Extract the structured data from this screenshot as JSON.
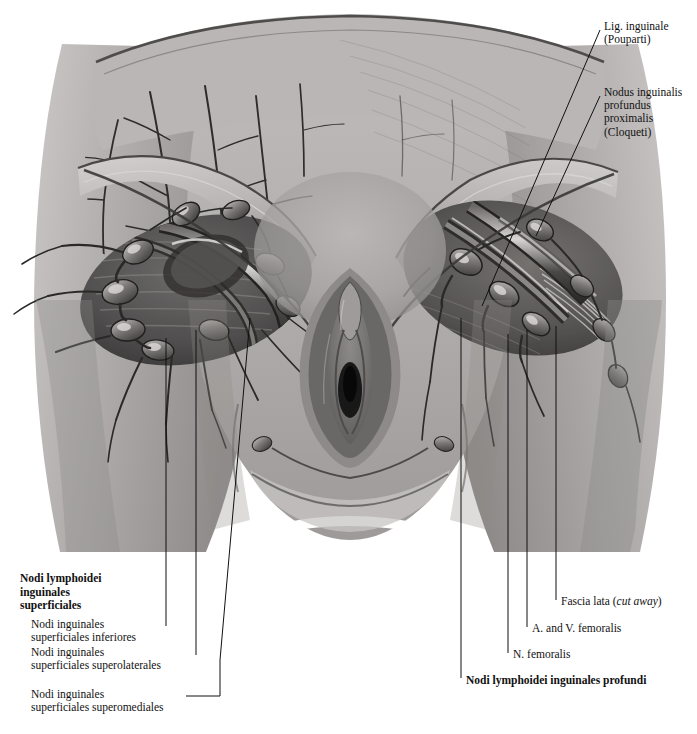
{
  "figure": {
    "kind": "anatomical-illustration",
    "style": "grayscale halftone medical plate",
    "background_color": "#ffffff",
    "ink_color": "#111111"
  },
  "labels": {
    "lig_inguinale": "Lig. inguinale\n(Pouparti)",
    "nodus_cloqueti": "Nodus inguinalis\nprofundus\nproximalis\n(Cloqueti)",
    "nodi_superficiales_heading": "Nodi lymphoidei\ninguinales\nsuperficiales",
    "nodi_inferiores": "Nodi inguinales\nsuperficiales inferiores",
    "nodi_superolaterales": "Nodi inguinales\nsuperficiales superolaterales",
    "nodi_superomediales": "Nodi inguinales\nsuperficiales superomediales",
    "fascia_lata_prefix": "Fascia lata (",
    "fascia_lata_italic": "cut away",
    "fascia_lata_suffix": ")",
    "a_v_femoralis": "A. and V. femoralis",
    "n_femoralis": "N. femoralis",
    "nodi_profundi_heading": "Nodi lymphoidei inguinales profundi"
  },
  "palette": {
    "skin_light": "#cfcccb",
    "skin_mid": "#a8a5a4",
    "skin_dark": "#7e7b7b",
    "shadow": "#5d5b5b",
    "deep_shadow": "#3a3938",
    "vessel_dark": "#2a2928",
    "highlight": "#e7e5e4",
    "white": "#ffffff"
  }
}
